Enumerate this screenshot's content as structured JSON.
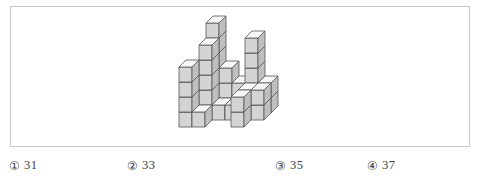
{
  "figure": {
    "name": "stacked-cubes-isometric-figure",
    "colors": {
      "frame_border": "#c9c9c9",
      "cube_top": "#f7f7f7",
      "cube_front": "#d4d4d4",
      "cube_side": "#bfbfbf",
      "cube_outline": "#555555",
      "background": "#ffffff"
    },
    "geometry": {
      "cube_width": 13,
      "cube_height": 15,
      "depth_x": 7,
      "depth_y": -7,
      "origin_x": 168,
      "origin_y": 120
    },
    "columns": [
      {
        "col": 0,
        "row": 0,
        "height": 4
      },
      {
        "col": 0,
        "row": 1,
        "height": 1
      },
      {
        "col": 1,
        "row": 0,
        "height": 1
      },
      {
        "col": 1,
        "row": 1,
        "height": 5
      },
      {
        "col": 1,
        "row": 2,
        "height": 6
      },
      {
        "col": 2,
        "row": 1,
        "height": 1
      },
      {
        "col": 2,
        "row": 2,
        "height": 3
      },
      {
        "col": 3,
        "row": 1,
        "height": 1
      },
      {
        "col": 3,
        "row": 2,
        "height": 2
      },
      {
        "col": 4,
        "row": 0,
        "height": 2
      },
      {
        "col": 4,
        "row": 1,
        "height": 2
      },
      {
        "col": 4,
        "row": 2,
        "height": 5
      },
      {
        "col": 5,
        "row": 1,
        "height": 2
      },
      {
        "col": 5,
        "row": 2,
        "height": 2
      }
    ]
  },
  "options": {
    "items": [
      {
        "marker": "①",
        "value": "31"
      },
      {
        "marker": "②",
        "value": "33"
      },
      {
        "marker": "③",
        "value": "35"
      },
      {
        "marker": "④",
        "value": "37"
      }
    ]
  }
}
